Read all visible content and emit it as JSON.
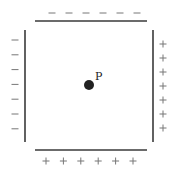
{
  "diagram": {
    "point_label": "P",
    "plates": {
      "top": {
        "charge": "negative",
        "symbol": "−",
        "count": 6
      },
      "left": {
        "charge": "negative",
        "symbol": "−",
        "count": 7
      },
      "right": {
        "charge": "positive",
        "symbol": "+",
        "count": 7
      },
      "bottom": {
        "charge": "positive",
        "symbol": "+",
        "count": 6
      }
    },
    "colors": {
      "plate": "#3a3a3a",
      "sign": "#777777",
      "dot": "#222222"
    }
  }
}
